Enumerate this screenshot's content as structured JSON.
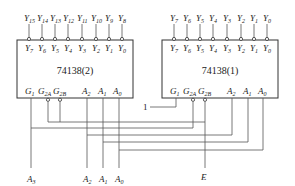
{
  "diagram": {
    "type": "logic-circuit",
    "chips": [
      {
        "id": "chip2",
        "label": "74138(2)",
        "outputs_inner": [
          "Y7",
          "Y6",
          "Y5",
          "Y4",
          "Y3",
          "Y2",
          "Y1",
          "Y0"
        ],
        "outputs_outer": [
          "Y15",
          "Y14",
          "Y13",
          "Y12",
          "Y11",
          "Y10",
          "Y9",
          "Y8"
        ],
        "inputs": [
          "G1",
          "G2A",
          "G2B",
          "A2",
          "A1",
          "A0"
        ]
      },
      {
        "id": "chip1",
        "label": "74138(1)",
        "outputs_inner": [
          "Y7",
          "Y6",
          "Y5",
          "Y4",
          "Y3",
          "Y2",
          "Y1",
          "Y0"
        ],
        "outputs_outer": [
          "Y7",
          "Y6",
          "Y5",
          "Y4",
          "Y3",
          "Y2",
          "Y1",
          "Y0"
        ],
        "inputs": [
          "G1",
          "G2A",
          "G2B",
          "A2",
          "A1",
          "A0"
        ]
      }
    ],
    "external_inputs": {
      "a3": "A3",
      "a2": "A2",
      "a1": "A1",
      "a0": "A0",
      "enable": "E",
      "const_one": "1"
    }
  }
}
